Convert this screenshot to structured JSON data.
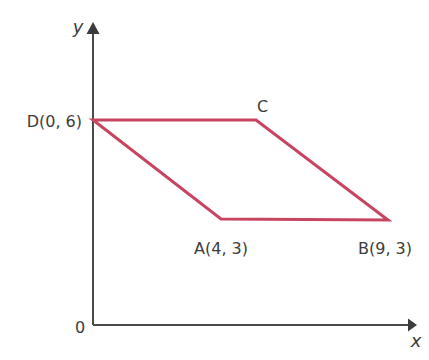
{
  "figure": {
    "kind": "coordinate-geometry-diagram",
    "background_color": "#ffffff",
    "width": 429,
    "height": 360
  },
  "axes": {
    "x_label": "x",
    "y_label": "y",
    "origin_label": "0",
    "color": "#4a4a4a",
    "stroke_width": 2,
    "x_axis_y_px": 325,
    "y_axis_x_px": 93,
    "x_axis_end_px": 417,
    "y_axis_top_px": 22
  },
  "shape": {
    "name": "parallelogram-ABCD",
    "color": "#c8455f",
    "stroke_width": 3,
    "fill": "none",
    "path": "M 93 120 L 256 120 L 388 220 L 221 219 Z"
  },
  "vertices": [
    {
      "id": "D",
      "label": "D(0, 6)",
      "coords": [
        0,
        6
      ],
      "px": [
        93,
        120
      ],
      "label_px": [
        82,
        127
      ],
      "label_anchor": "end"
    },
    {
      "id": "C",
      "label": "C",
      "coords": null,
      "px": [
        256,
        120
      ],
      "label_px": [
        257,
        112
      ],
      "label_anchor": "start"
    },
    {
      "id": "A",
      "label": "A(4, 3)",
      "coords": [
        4,
        3
      ],
      "px": [
        221,
        219
      ],
      "label_px": [
        221,
        254
      ],
      "label_anchor": "middle"
    },
    {
      "id": "B",
      "label": "B(9, 3)",
      "coords": [
        9,
        3
      ],
      "px": [
        388,
        220
      ],
      "label_px": [
        385,
        254
      ],
      "label_anchor": "middle"
    }
  ],
  "chart_data": {
    "type": "scatter",
    "title": "",
    "xlabel": "x",
    "ylabel": "y",
    "grid": false,
    "legend": "none",
    "series": [
      {
        "name": "Parallelogram ABCD",
        "color": "#c8455f",
        "closed": true,
        "points": [
          {
            "label": "D(0, 6)",
            "x": 0,
            "y": 6
          },
          {
            "label": "C",
            "x": 5,
            "y": 6
          },
          {
            "label": "B(9, 3)",
            "x": 9,
            "y": 3
          },
          {
            "label": "A(4, 3)",
            "x": 4,
            "y": 3
          }
        ]
      }
    ],
    "annotations": [
      "D(0, 6)",
      "C",
      "A(4, 3)",
      "B(9, 3)",
      "0"
    ]
  }
}
